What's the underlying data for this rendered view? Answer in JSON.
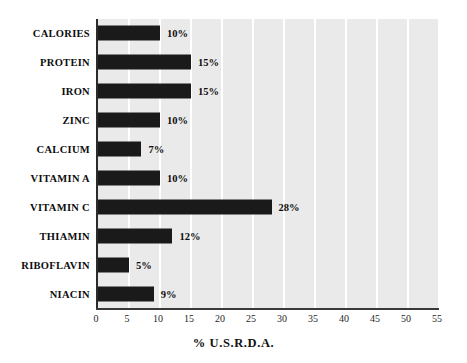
{
  "chart_data": {
    "type": "bar",
    "orientation": "horizontal",
    "title": "",
    "xlabel": "% U.S.R.D.A.",
    "ylabel": "",
    "xlim": [
      0,
      55
    ],
    "xticks": [
      "0",
      "5",
      "10",
      "15",
      "20",
      "25",
      "30",
      "35",
      "40",
      "45",
      "50",
      "55"
    ],
    "grid": true,
    "legend": "none",
    "categories": [
      "CALORIES",
      "PROTEIN",
      "IRON",
      "ZINC",
      "CALCIUM",
      "VITAMIN A",
      "VITAMIN C",
      "THIAMIN",
      "RIBOFLAVIN",
      "NIACIN"
    ],
    "values": [
      10,
      15,
      15,
      10,
      7,
      10,
      28,
      12,
      5,
      9
    ],
    "value_labels": [
      "10%",
      "15%",
      "15%",
      "10%",
      "7%",
      "10%",
      "28%",
      "12%",
      "5%",
      "9%"
    ],
    "bar_color": "#1a1a1a",
    "plot_background": "#eaeaea",
    "gridline_color": "#ffffff",
    "axis_color": "#2b2b2b",
    "figure_background": "#ffffff"
  }
}
